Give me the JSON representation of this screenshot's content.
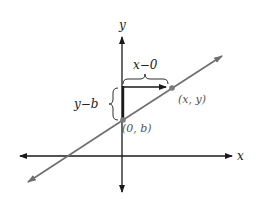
{
  "diagram": {
    "axes": {
      "x_label": "x",
      "y_label": "y"
    },
    "points": [
      {
        "label": "(0, b)"
      },
      {
        "label": "(x, y)"
      }
    ],
    "annotations": {
      "horizontal_run": "x−0",
      "vertical_rise": "y−b"
    },
    "colors": {
      "axis": "#1a1a1a",
      "line": "#6e6e6e",
      "point": "#7a7a7a",
      "label_gray": "#555555",
      "label_dark": "#222222"
    }
  }
}
